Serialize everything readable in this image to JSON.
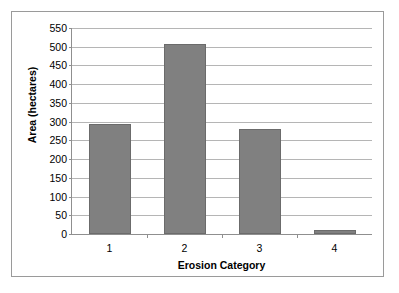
{
  "chart_data": {
    "type": "bar",
    "title": "",
    "xlabel": "Erosion Category",
    "ylabel": "Area (hectares)",
    "categories": [
      "1",
      "2",
      "3",
      "4"
    ],
    "values": [
      293,
      507,
      281,
      11
    ],
    "series": [
      {
        "name": "Area",
        "values": [
          293,
          507,
          281,
          11
        ]
      }
    ],
    "ylim": [
      0,
      550
    ],
    "ytick_labels": [
      "0",
      "50",
      "100",
      "150",
      "200",
      "250",
      "300",
      "350",
      "400",
      "450",
      "500",
      "550"
    ],
    "ytick_values": [
      0,
      50,
      100,
      150,
      200,
      250,
      300,
      350,
      400,
      450,
      500,
      550
    ],
    "grid": true,
    "legend": false,
    "legend_position": "none",
    "colors": {
      "bar_fill": "#808080",
      "bar_border": "#6b6b6b",
      "gridline": "#b5b5b5",
      "axis": "#8f8f8f",
      "frame": "#9a9a9a",
      "background": "#ffffff",
      "text": "#000000"
    }
  }
}
